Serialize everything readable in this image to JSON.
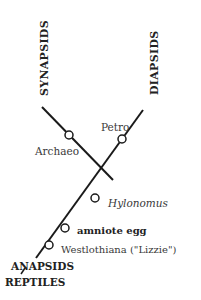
{
  "diagram": {
    "type": "cladogram",
    "clades": {
      "synapsids": "SYNAPSIDS",
      "diapsids": "DIAPSIDS",
      "anapsids": "ANAPSIDS",
      "reptiles": "REPTILES"
    },
    "nodes": {
      "archaeo": "Archaeo",
      "petro": "Petro",
      "hylonomus": "Hylonomus",
      "amniote_egg": "amniote  egg",
      "westlothiana": "Westlothiana (\"Lizzie\")"
    },
    "colors": {
      "line": "#1a1a1a",
      "text": "#3a3a3a",
      "background": "#ffffff"
    }
  }
}
